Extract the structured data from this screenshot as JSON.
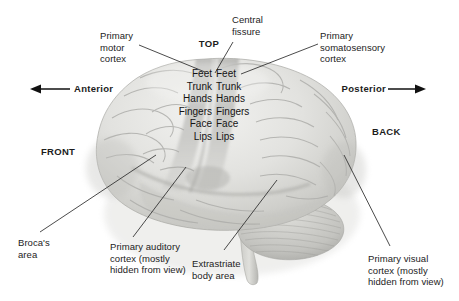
{
  "figure": {
    "orientation": {
      "top_label": "TOP",
      "front_label": "FRONT",
      "back_label": "BACK",
      "anterior_label": "Anterior",
      "posterior_label": "Posterior"
    }
  },
  "callouts": {
    "primary_motor_cortex": "Primary\nmotor\ncortex",
    "central_fissure": "Central\nfissure",
    "primary_somatosensory_cortex": "Primary\nsomatosensory\ncortex",
    "brocas_area": "Broca's\narea",
    "primary_auditory_cortex": "Primary auditory\ncortex (mostly\nhidden from view)",
    "extrastriate_body_area": "Extrastriate\nbody area",
    "primary_visual_cortex": "Primary visual\ncortex (mostly\nhidden from view)"
  },
  "homunculus": {
    "motor_column": "Feet\nTrunk\nHands\nFingers\nFace\nLips",
    "somatosensory_column": "Feet\nTrunk\nHands\nFingers\nFace\nLips",
    "parts": [
      "Feet",
      "Trunk",
      "Hands",
      "Fingers",
      "Face",
      "Lips"
    ]
  },
  "colors": {
    "background": "#ffffff",
    "text": "#1c1c1c",
    "leader_line": "#2b2b2b",
    "brain_light": "#e9e9e7",
    "brain_mid": "#d2d2cf",
    "brain_shadow": "#b4b4b1",
    "strip_band": "#9e9e9b"
  }
}
